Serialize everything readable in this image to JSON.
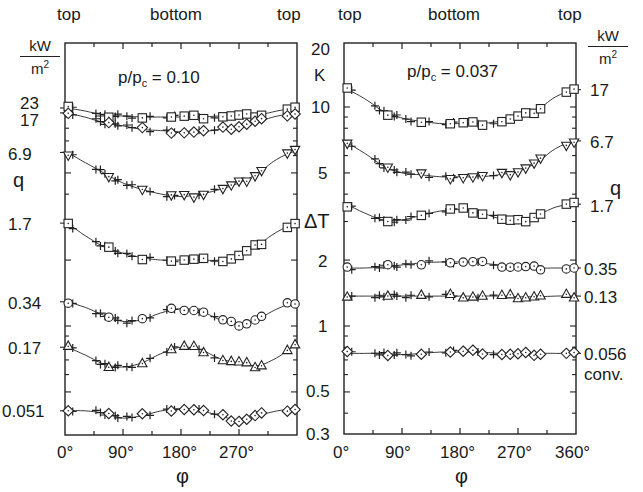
{
  "figure": {
    "left_axis": {
      "unit_num": "kW",
      "unit_den": "m",
      "unit_den_exp": "2",
      "label": "q"
    },
    "right_axis": {
      "unit_num": "kW",
      "unit_den": "m",
      "unit_den_exp": "2",
      "label": "q"
    },
    "center_axis": {
      "label": "ΔT",
      "unit": "K",
      "ticks": [
        "20",
        "10",
        "5",
        "2",
        "1",
        "0.5",
        "0.3"
      ]
    },
    "x_axis": {
      "label": "φ"
    }
  },
  "chart_data": [
    {
      "type": "line",
      "title": "p/pc = 0.10",
      "title_main": "p/p",
      "title_sub": "c",
      "title_value": " = 0.10",
      "top_labels": [
        "top",
        "bottom",
        "top"
      ],
      "xlabel": "φ",
      "ylabel": "ΔT (K)",
      "ylabel_secondary": "q (kW/m²)",
      "xlim": [
        0,
        360
      ],
      "ylim": [
        0.3,
        20
      ],
      "yscale": "log",
      "x_tick_labels": [
        "0°",
        "90°",
        "180°",
        "270°"
      ],
      "x": [
        0,
        30,
        60,
        90,
        120,
        150,
        180,
        210,
        240,
        270,
        300,
        330,
        360
      ],
      "series": [
        {
          "name": "23",
          "marker": "square",
          "values": [
            9.9,
            9.6,
            9.2,
            9.1,
            9.0,
            9.0,
            9.0,
            9.0,
            9.1,
            9.1,
            9.2,
            9.6,
            9.9
          ]
        },
        {
          "name": "17",
          "marker": "diamond",
          "values": [
            9.4,
            9.0,
            8.5,
            8.2,
            7.9,
            7.8,
            7.7,
            7.7,
            7.9,
            8.2,
            8.6,
            9.1,
            9.4
          ]
        },
        {
          "name": "6.9",
          "marker": "triangle-down",
          "values": [
            6.2,
            5.6,
            5.0,
            4.5,
            4.2,
            4.0,
            3.9,
            4.0,
            4.2,
            4.5,
            5.0,
            5.8,
            6.3
          ]
        },
        {
          "name": "1.7",
          "marker": "square",
          "values": [
            2.95,
            2.6,
            2.3,
            2.15,
            2.05,
            2.0,
            2.0,
            2.0,
            2.0,
            2.1,
            2.35,
            2.7,
            2.95
          ]
        },
        {
          "name": "0.34",
          "marker": "circle",
          "values": [
            1.29,
            1.22,
            1.12,
            1.05,
            1.07,
            1.15,
            1.2,
            1.17,
            1.07,
            1.02,
            1.08,
            1.2,
            1.29
          ]
        },
        {
          "name": "0.17",
          "marker": "triangle-up",
          "values": [
            0.8,
            0.74,
            0.67,
            0.65,
            0.68,
            0.75,
            0.8,
            0.78,
            0.71,
            0.68,
            0.66,
            0.72,
            0.82
          ]
        },
        {
          "name": "0.051",
          "marker": "diamond",
          "values": [
            0.41,
            0.41,
            0.4,
            0.38,
            0.39,
            0.41,
            0.42,
            0.41,
            0.39,
            0.37,
            0.39,
            0.41,
            0.42
          ]
        }
      ]
    },
    {
      "type": "line",
      "title": "p/pc = 0.037",
      "title_main": "p/p",
      "title_sub": "c",
      "title_value": " = 0.037",
      "top_labels": [
        "top",
        "bottom",
        "top"
      ],
      "xlabel": "φ",
      "ylabel": "ΔT (K)",
      "ylabel_secondary": "q (kW/m²)",
      "xlim": [
        0,
        360
      ],
      "ylim": [
        0.3,
        20
      ],
      "yscale": "log",
      "x_tick_labels": [
        "0°",
        "90°",
        "180°",
        "270°",
        "360°"
      ],
      "x": [
        0,
        30,
        60,
        90,
        120,
        150,
        180,
        210,
        240,
        270,
        300,
        330,
        360
      ],
      "series": [
        {
          "name": "17",
          "marker": "square",
          "values": [
            12.1,
            11.0,
            9.6,
            8.9,
            8.6,
            8.4,
            8.4,
            8.4,
            8.6,
            9.0,
            9.7,
            11.2,
            12.0
          ]
        },
        {
          "name": "6.7",
          "marker": "triangle-down",
          "values": [
            6.9,
            6.2,
            5.4,
            5.0,
            4.9,
            4.8,
            4.8,
            4.8,
            4.9,
            5.1,
            5.6,
            6.5,
            7.0
          ]
        },
        {
          "name": "1.7",
          "marker": "square",
          "values": [
            3.6,
            3.3,
            3.05,
            3.05,
            3.2,
            3.35,
            3.4,
            3.3,
            3.1,
            3.0,
            3.2,
            3.5,
            3.6
          ]
        },
        {
          "name": "0.35",
          "marker": "circle",
          "values": [
            1.84,
            1.84,
            1.86,
            1.9,
            1.94,
            1.96,
            1.96,
            1.94,
            1.9,
            1.86,
            1.84,
            1.84,
            1.84
          ]
        },
        {
          "name": "0.13",
          "marker": "triangle-up",
          "values": [
            1.37,
            1.37,
            1.37,
            1.37,
            1.37,
            1.37,
            1.37,
            1.37,
            1.37,
            1.36,
            1.36,
            1.37,
            1.37
          ]
        },
        {
          "name": "0.056",
          "marker": "diamond",
          "values": [
            0.75,
            0.75,
            0.75,
            0.74,
            0.75,
            0.76,
            0.76,
            0.76,
            0.75,
            0.74,
            0.75,
            0.75,
            0.75
          ]
        }
      ],
      "annotation": "conv."
    }
  ],
  "layout": {
    "line_color": "#222222",
    "marker_color": "#222222",
    "background": "#ffffff"
  }
}
